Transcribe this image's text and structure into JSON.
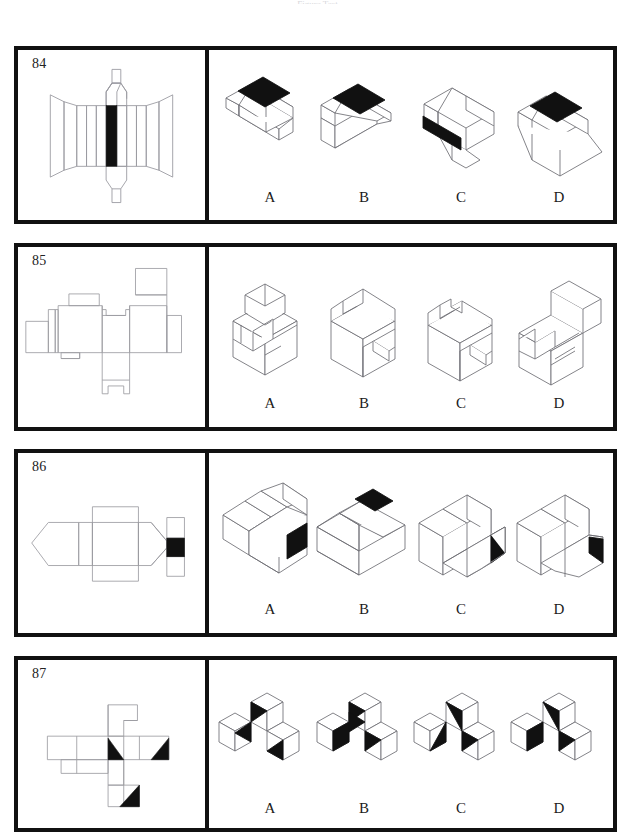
{
  "page": {
    "header_faint_text": "Figure Test",
    "background_color": "#ffffff",
    "border_color": "#111111",
    "fill_black": "#111111",
    "line_color": "#9a9aa0"
  },
  "puzzles": [
    {
      "number": "84",
      "net_description": "Cross-shaped unfolded net: a wide horizontal band of flared trapezoid panels with vertical strips, a solid black rectangular face at the centre, and octagonal end flaps extending above and below with small tabs.",
      "options": [
        {
          "label": "A",
          "shape": "prism-with-black-top-stripe-left-lean"
        },
        {
          "label": "B",
          "shape": "prism-with-black-top-stripe-right-lean"
        },
        {
          "label": "C",
          "shape": "prism-with-black-front-stripe"
        },
        {
          "label": "D",
          "shape": "prism-with-black-top-stripe-wide-base"
        }
      ]
    },
    {
      "number": "85",
      "net_description": "Flat unfolded net of an L-shaped seat block: stepped rectangular panels arranged left-to-right with square flaps above and a notched tab below.",
      "options": [
        {
          "label": "A",
          "shape": "chair-block-facing-left"
        },
        {
          "label": "B",
          "shape": "chair-block-facing-right"
        },
        {
          "label": "C",
          "shape": "chair-block-seat-front"
        },
        {
          "label": "D",
          "shape": "chair-block-channel-seat"
        }
      ]
    },
    {
      "number": "86",
      "net_description": "Horizontal net with a pointed hexagonal end cap on the left, long rectangular panels in the middle, a tall square flap, and a narrow vertical strip on the right containing a solid black square.",
      "options": [
        {
          "label": "A",
          "shape": "angled-block-black-front-right"
        },
        {
          "label": "B",
          "shape": "slab-block-black-top-facet"
        },
        {
          "label": "C",
          "shape": "l-block-black-right-end"
        },
        {
          "label": "D",
          "shape": "chamfered-l-block-black-right-end"
        }
      ]
    },
    {
      "number": "87",
      "net_description": "Cross/step shaped cube net of squares with three black right-triangle markings on separate faces.",
      "options": [
        {
          "label": "A",
          "shape": "three-cubes-two-black-triangles"
        },
        {
          "label": "B",
          "shape": "three-cubes-three-black-triangles-left"
        },
        {
          "label": "C",
          "shape": "three-cubes-black-triangles-upper-left"
        },
        {
          "label": "D",
          "shape": "three-cubes-four-black-triangles"
        }
      ]
    }
  ]
}
